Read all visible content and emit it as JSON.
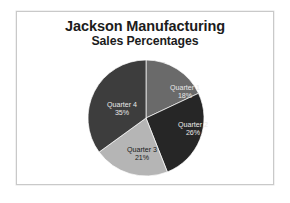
{
  "slide": {
    "title": "Jackson Manufacturing",
    "subtitle": "Sales Percentages"
  },
  "chart_data": {
    "type": "pie",
    "title": "Jackson Manufacturing",
    "subtitle": "Sales Percentages",
    "categories": [
      "Quarter 1",
      "Quarter 2",
      "Quarter 3",
      "Quarter 4"
    ],
    "values": [
      18,
      26,
      21,
      35
    ],
    "value_unit": "%",
    "labels": [
      {
        "name": "Quarter 1",
        "pct": "18%",
        "color": "#6a6a6a",
        "label_color": "#e8e8e8"
      },
      {
        "name": "Quarter 2",
        "pct": "26%",
        "color": "#262626",
        "label_color": "#e8e8e8"
      },
      {
        "name": "Quarter 3",
        "pct": "21%",
        "color": "#b5b5b5",
        "label_color": "#1a1a1a"
      },
      {
        "name": "Quarter 4",
        "pct": "35%",
        "color": "#3d3d3d",
        "label_color": "#e8e8e8"
      }
    ],
    "colors": [
      "#6a6a6a",
      "#262626",
      "#b5b5b5",
      "#3d3d3d"
    ],
    "start_angle_deg": 0,
    "direction": "clockwise",
    "legend": "none",
    "data_labels": "inside",
    "grid": false,
    "xlabel": "",
    "ylabel": ""
  }
}
